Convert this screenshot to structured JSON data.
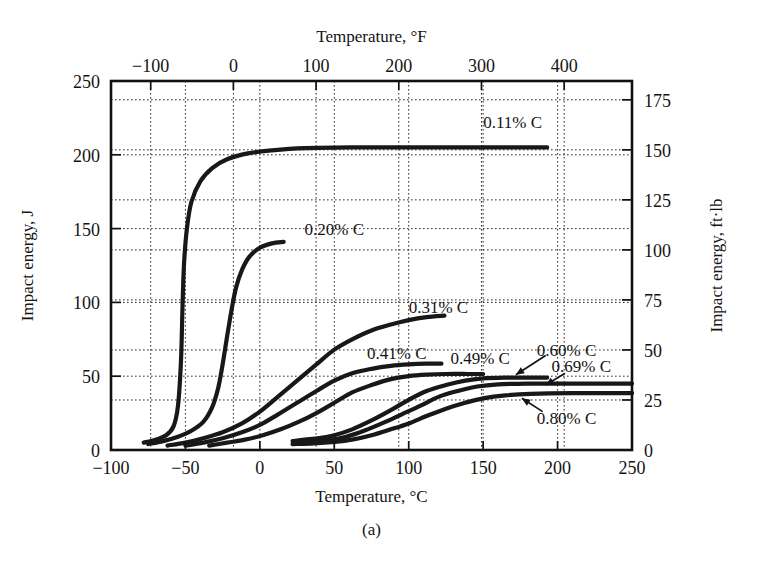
{
  "figure": {
    "label": "(a)",
    "panel_name": "impact-energy-vs-temperature"
  },
  "chart_data": {
    "type": "line",
    "title": "",
    "xlabel": "Temperature, °C",
    "ylabel": "Impact energy, J",
    "x2label": "Temperature, °F",
    "y2label": "Impact energy, ft·lb",
    "xlim": [
      -100,
      250
    ],
    "ylim": [
      0,
      250
    ],
    "x2lim": [
      -148,
      482
    ],
    "y2lim": [
      0,
      184.4
    ],
    "xticks": [
      -100,
      -50,
      0,
      50,
      100,
      150,
      200,
      250
    ],
    "xticklabels": [
      "−100",
      "−50",
      "0",
      "50",
      "100",
      "150",
      "200",
      "250"
    ],
    "yticks": [
      0,
      50,
      100,
      150,
      200,
      250
    ],
    "yticklabels": [
      "0",
      "50",
      "100",
      "150",
      "200",
      "250"
    ],
    "x2ticks": [
      -100,
      0,
      100,
      200,
      300,
      400
    ],
    "x2ticklabels": [
      "−100",
      "0",
      "100",
      "200",
      "300",
      "400"
    ],
    "y2ticks": [
      0,
      25,
      50,
      75,
      100,
      125,
      150,
      175
    ],
    "y2ticklabels": [
      "0",
      "25",
      "50",
      "75",
      "100",
      "125",
      "150",
      "175"
    ],
    "grid": true,
    "grid_style": "dotted",
    "legend_position": "inline-curve-labels",
    "curve_color": "#181818",
    "series": [
      {
        "name": "0.11% C",
        "label": "0.11% C",
        "points": [
          [
            -78,
            5
          ],
          [
            -70,
            7
          ],
          [
            -63,
            10
          ],
          [
            -58,
            16
          ],
          [
            -55,
            30
          ],
          [
            -53,
            60
          ],
          [
            -52,
            95
          ],
          [
            -51,
            125
          ],
          [
            -49,
            150
          ],
          [
            -46,
            168
          ],
          [
            -40,
            182
          ],
          [
            -32,
            191
          ],
          [
            -22,
            197
          ],
          [
            -8,
            201
          ],
          [
            8,
            203
          ],
          [
            30,
            204.5
          ],
          [
            60,
            205
          ],
          [
            100,
            205
          ],
          [
            140,
            205
          ],
          [
            193,
            205
          ]
        ],
        "label_x": 150,
        "label_y": 222
      },
      {
        "name": "0.20% C",
        "label": "0.20% C",
        "points": [
          [
            -75,
            4
          ],
          [
            -65,
            6
          ],
          [
            -55,
            9
          ],
          [
            -46,
            13
          ],
          [
            -38,
            19
          ],
          [
            -32,
            29
          ],
          [
            -28,
            42
          ],
          [
            -25,
            58
          ],
          [
            -22,
            77
          ],
          [
            -19,
            95
          ],
          [
            -16,
            110
          ],
          [
            -12,
            122
          ],
          [
            -7,
            131
          ],
          [
            0,
            137
          ],
          [
            8,
            140
          ],
          [
            16,
            141
          ]
        ],
        "label_x": 30,
        "label_y": 150
      },
      {
        "name": "0.31% C",
        "label": "0.31% C",
        "points": [
          [
            -62,
            3
          ],
          [
            -50,
            5
          ],
          [
            -38,
            8
          ],
          [
            -25,
            12
          ],
          [
            -12,
            18
          ],
          [
            0,
            26
          ],
          [
            12,
            36
          ],
          [
            25,
            47
          ],
          [
            38,
            58
          ],
          [
            50,
            68
          ],
          [
            62,
            75
          ],
          [
            75,
            81
          ],
          [
            88,
            85
          ],
          [
            100,
            88
          ],
          [
            112,
            90
          ],
          [
            124,
            91
          ]
        ],
        "label_x": 100,
        "label_y": 97
      },
      {
        "name": "0.41% C",
        "label": "0.41% C",
        "points": [
          [
            -50,
            3
          ],
          [
            -38,
            5
          ],
          [
            -25,
            8
          ],
          [
            -12,
            12
          ],
          [
            0,
            17
          ],
          [
            12,
            24
          ],
          [
            25,
            32
          ],
          [
            38,
            40
          ],
          [
            50,
            47
          ],
          [
            62,
            52
          ],
          [
            75,
            55
          ],
          [
            88,
            57
          ],
          [
            100,
            58
          ],
          [
            112,
            58.5
          ],
          [
            122,
            58.5
          ]
        ],
        "label_x": 72,
        "label_y": 66
      },
      {
        "name": "0.49% C",
        "label": "0.49% C",
        "points": [
          [
            -34,
            3
          ],
          [
            -22,
            5
          ],
          [
            -10,
            7
          ],
          [
            2,
            10
          ],
          [
            14,
            14
          ],
          [
            26,
            19
          ],
          [
            38,
            25
          ],
          [
            50,
            32
          ],
          [
            62,
            39
          ],
          [
            75,
            44
          ],
          [
            88,
            48
          ],
          [
            100,
            50
          ],
          [
            112,
            51
          ],
          [
            125,
            51.5
          ],
          [
            140,
            51.5
          ],
          [
            150,
            51.5
          ]
        ],
        "label_x": 128,
        "label_y": 62
      },
      {
        "name": "0.60% C",
        "label": "0.60% C",
        "points": [
          [
            22,
            6
          ],
          [
            30,
            7
          ],
          [
            40,
            8
          ],
          [
            50,
            10
          ],
          [
            62,
            14
          ],
          [
            75,
            20
          ],
          [
            88,
            27
          ],
          [
            100,
            34
          ],
          [
            112,
            40
          ],
          [
            125,
            44
          ],
          [
            138,
            47
          ],
          [
            150,
            48.5
          ],
          [
            165,
            49
          ],
          [
            180,
            49
          ],
          [
            193,
            49
          ]
        ],
        "label_x": 186,
        "label_y": 68,
        "arrow_from": [
          192,
          64
        ],
        "arrow_to": [
          172,
          51
        ]
      },
      {
        "name": "0.69% C",
        "label": "0.69% C",
        "points": [
          [
            24,
            5
          ],
          [
            34,
            5.5
          ],
          [
            45,
            6.5
          ],
          [
            58,
            9
          ],
          [
            70,
            13
          ],
          [
            82,
            18
          ],
          [
            95,
            24
          ],
          [
            108,
            30
          ],
          [
            120,
            36
          ],
          [
            133,
            40
          ],
          [
            146,
            43
          ],
          [
            160,
            44.5
          ],
          [
            180,
            45
          ],
          [
            210,
            45
          ],
          [
            250,
            45
          ]
        ],
        "label_x": 196,
        "label_y": 57,
        "arrow_from": [
          205,
          52
        ],
        "arrow_to": [
          192,
          44
        ]
      },
      {
        "name": "0.80% C",
        "label": "0.80% C",
        "points": [
          [
            22,
            4
          ],
          [
            36,
            4.5
          ],
          [
            50,
            5.5
          ],
          [
            62,
            7
          ],
          [
            75,
            10
          ],
          [
            88,
            14
          ],
          [
            100,
            18
          ],
          [
            112,
            23
          ],
          [
            125,
            28
          ],
          [
            138,
            32
          ],
          [
            150,
            35
          ],
          [
            165,
            37
          ],
          [
            182,
            38
          ],
          [
            210,
            38.5
          ],
          [
            250,
            38.5
          ]
        ],
        "label_x": 186,
        "label_y": 22,
        "arrow_from": [
          190,
          26
        ],
        "arrow_to": [
          176,
          35
        ]
      }
    ]
  }
}
